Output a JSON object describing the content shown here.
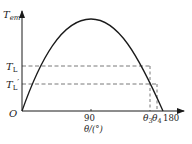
{
  "diagram": {
    "type": "torque-angle curve",
    "y_axis": {
      "label": "T",
      "label_sub": "em"
    },
    "x_axis": {
      "label": "θ/(°)",
      "ticks": [
        "90",
        "180"
      ]
    },
    "origin_label": "O",
    "levels": [
      {
        "label": "T",
        "sub": "L",
        "prime": ""
      },
      {
        "label": "T",
        "sub": "L",
        "prime": "′"
      }
    ],
    "angles": [
      {
        "label": "θ",
        "sub": "3"
      },
      {
        "label": "θ",
        "sub": "4"
      }
    ]
  }
}
